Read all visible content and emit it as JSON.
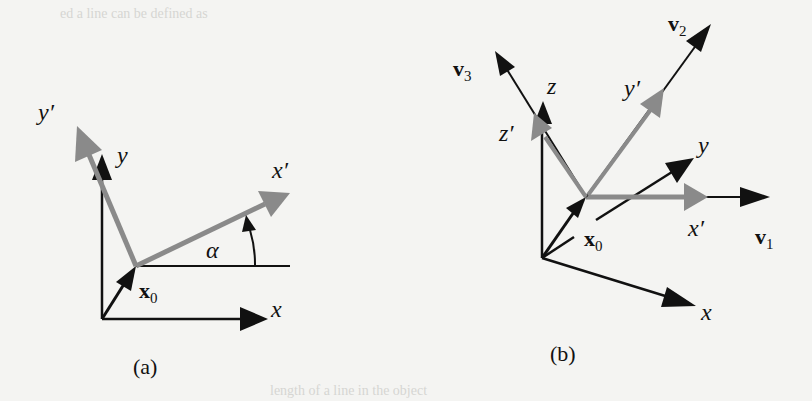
{
  "figure": {
    "bleed_text_top": "ed a line can be defined as",
    "bleed_text_bottom": "length of a line in the object",
    "panel_a": {
      "caption": "(a)",
      "labels": {
        "y_prime": "y′",
        "y": "y",
        "x_prime": "x′",
        "x": "x",
        "alpha": "α",
        "x0_main": "x",
        "x0_sub": "0"
      }
    },
    "panel_b": {
      "caption": "(b)",
      "labels": {
        "v3_main": "v",
        "v3_sub": "3",
        "v2_main": "v",
        "v2_sub": "2",
        "v1_main": "v",
        "v1_sub": "1",
        "z": "z",
        "z_prime": "z′",
        "y_prime": "y′",
        "y": "y",
        "x_prime": "x′",
        "x": "x",
        "x0_main": "x",
        "x0_sub": "0"
      }
    },
    "colors": {
      "black_axis": "#111111",
      "gray_axis": "#8a8a8a",
      "background": "#f4f4f2"
    }
  }
}
